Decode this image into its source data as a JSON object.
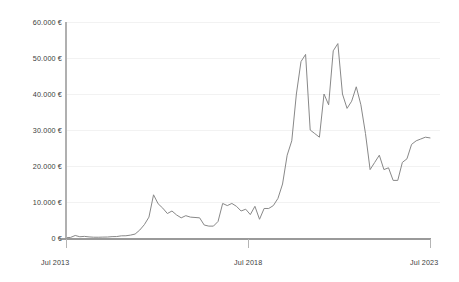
{
  "chart_data": {
    "type": "line",
    "title": "",
    "subtitle": "",
    "xlabel": "",
    "ylabel": "",
    "grid": true,
    "legend": false,
    "legend_position": "none",
    "line_color": "#888888",
    "currency_symbol": "€",
    "ylim": [
      0,
      60000
    ],
    "ytick_values": [
      0,
      10000,
      20000,
      30000,
      40000,
      50000,
      60000
    ],
    "ytick_labels": [
      "0 €",
      "10.000 €",
      "20.000 €",
      "30.000 €",
      "40.000 €",
      "50.000 €",
      "60.000 €"
    ],
    "xlim": [
      "Jul 2013",
      "Jul 2023"
    ],
    "xtick_labels": [
      "Jul 2013",
      "Jul 2018",
      "Jul 2023"
    ],
    "xtick_positions": [
      0.0,
      0.5,
      1.0
    ],
    "series": [
      {
        "name": "Price",
        "x": [
          "2013-07",
          "2013-10",
          "2014-01",
          "2014-04",
          "2014-07",
          "2014-10",
          "2015-01",
          "2015-04",
          "2015-07",
          "2015-10",
          "2016-01",
          "2016-04",
          "2016-07",
          "2016-10",
          "2017-01",
          "2017-04",
          "2017-07",
          "2017-09",
          "2017-11",
          "2017-12",
          "2018-01",
          "2018-02",
          "2018-03",
          "2018-04",
          "2018-05",
          "2018-06",
          "2018-07",
          "2018-08",
          "2018-09",
          "2018-10",
          "2018-11",
          "2018-12",
          "2019-02",
          "2019-04",
          "2019-06",
          "2019-07",
          "2019-08",
          "2019-09",
          "2019-10",
          "2019-11",
          "2019-12",
          "2020-02",
          "2020-03",
          "2020-05",
          "2020-07",
          "2020-09",
          "2020-10",
          "2020-11",
          "2020-12",
          "2021-01",
          "2021-02",
          "2021-03",
          "2021-04",
          "2021-05",
          "2021-06",
          "2021-07",
          "2021-08",
          "2021-09",
          "2021-10",
          "2021-11",
          "2021-12",
          "2022-01",
          "2022-02",
          "2022-03",
          "2022-04",
          "2022-05",
          "2022-06",
          "2022-07",
          "2022-08",
          "2022-09",
          "2022-10",
          "2022-11",
          "2022-12",
          "2023-01",
          "2023-02",
          "2023-03",
          "2023-04",
          "2023-05",
          "2023-06",
          "2023-07"
        ],
        "values": [
          80,
          160,
          700,
          350,
          450,
          300,
          220,
          210,
          250,
          270,
          380,
          400,
          600,
          620,
          800,
          1100,
          2200,
          3700,
          5800,
          12000,
          9500,
          8300,
          6800,
          7500,
          6400,
          5600,
          6200,
          5800,
          5700,
          5600,
          3600,
          3300,
          3300,
          4600,
          9600,
          9000,
          9600,
          8800,
          7500,
          8000,
          6500,
          8800,
          5200,
          8200,
          8200,
          9000,
          11000,
          15000,
          23000,
          27000,
          40000,
          49000,
          51000,
          30000,
          29000,
          28000,
          40000,
          37000,
          52000,
          54000,
          40000,
          36000,
          38000,
          42000,
          37000,
          29000,
          19000,
          21000,
          23000,
          19000,
          19500,
          16000,
          16000,
          21000,
          22000,
          26000,
          27000,
          27500,
          28000,
          27800
        ]
      }
    ],
    "annotations": []
  }
}
